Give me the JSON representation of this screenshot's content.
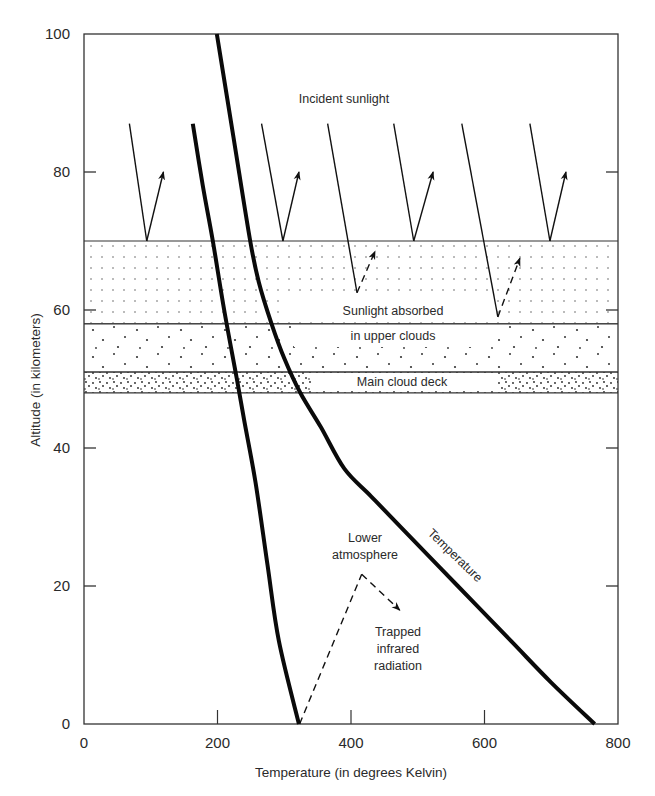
{
  "chart_data": {
    "type": "line",
    "title": "",
    "xlabel": "Temperature (in degrees Kelvin)",
    "ylabel": "Altitude (in kilometers)",
    "xlim": [
      0,
      800
    ],
    "ylim": [
      0,
      100
    ],
    "x_ticks": [
      0,
      200,
      400,
      600,
      800
    ],
    "y_ticks": [
      0,
      20,
      40,
      60,
      80,
      100
    ],
    "grid": false,
    "legend": null,
    "series": [
      {
        "name": "Temperature",
        "style": "thick solid",
        "points": [
          [
            199,
            100
          ],
          [
            224,
            85
          ],
          [
            249,
            70
          ],
          [
            262,
            64
          ],
          [
            281,
            58
          ],
          [
            300,
            53
          ],
          [
            324,
            48
          ],
          [
            355,
            43
          ],
          [
            390,
            37
          ],
          [
            430,
            33
          ],
          [
            480,
            28
          ],
          [
            560,
            20
          ],
          [
            640,
            12
          ],
          [
            700,
            6
          ],
          [
            765,
            0
          ]
        ]
      },
      {
        "name": "Lower curve",
        "style": "thick solid",
        "points": [
          [
            163,
            87
          ],
          [
            178,
            78
          ],
          [
            193,
            70
          ],
          [
            210,
            60
          ],
          [
            229,
            50
          ],
          [
            240,
            44
          ],
          [
            257,
            35
          ],
          [
            275,
            23
          ],
          [
            292,
            12
          ],
          [
            322,
            0
          ]
        ]
      }
    ],
    "layers": [
      {
        "name": "Upper cloud haze",
        "alt_top": 70,
        "alt_bottom": 58,
        "pattern": "fine-grid-dots"
      },
      {
        "name": "Upper clouds",
        "alt_top": 58,
        "alt_bottom": 51,
        "pattern": "sparse-dots"
      },
      {
        "name": "Main cloud deck",
        "alt_top": 51,
        "alt_bottom": 48,
        "pattern": "dense-dots"
      }
    ],
    "annotations": [
      {
        "text": "Incident sunlight",
        "x": 383,
        "y": 90
      },
      {
        "text": "Sunlight absorbed",
        "x": 480,
        "y": 60
      },
      {
        "text": "in upper clouds",
        "x": 480,
        "y": 56
      },
      {
        "text": "Main cloud deck",
        "x": 480,
        "y": 49.5
      },
      {
        "text": "Lower atmosphere",
        "x": 415,
        "y": 26
      },
      {
        "text": "Trapped infrared radiation",
        "x": 490,
        "y": 15
      },
      {
        "text": "Temperature",
        "x": 520,
        "y": 28,
        "rotation": 43
      }
    ],
    "arrows": [
      {
        "kind": "reflected",
        "from": [
          68,
          87
        ],
        "hit": [
          94,
          70
        ],
        "to": [
          119,
          80
        ]
      },
      {
        "kind": "reflected",
        "from": [
          266,
          87
        ],
        "hit": [
          298,
          70
        ],
        "to": [
          322,
          80
        ]
      },
      {
        "kind": "absorbed",
        "from": [
          365,
          87
        ],
        "hit": [
          409,
          62.5
        ],
        "to": [
          436,
          68.5
        ]
      },
      {
        "kind": "reflected",
        "from": [
          464,
          87
        ],
        "hit": [
          494,
          70
        ],
        "to": [
          523,
          80
        ]
      },
      {
        "kind": "absorbed",
        "from": [
          566,
          87
        ],
        "hit": [
          620,
          59
        ],
        "to": [
          653,
          67.5
        ]
      },
      {
        "kind": "reflected",
        "from": [
          668,
          87
        ],
        "hit": [
          698,
          70
        ],
        "to": [
          722,
          80
        ]
      },
      {
        "kind": "infrared",
        "from": [
          323,
          0
        ],
        "hit": [
          416,
          21.7
        ],
        "to": [
          473,
          16.5
        ]
      }
    ]
  },
  "labels": {
    "x_axis_title": "Temperature (in degrees Kelvin)",
    "y_axis_title": "Altitude (in kilometers)",
    "incident": "Incident sunlight",
    "absorbed_1": "Sunlight absorbed",
    "absorbed_2": "in upper clouds",
    "deck": "Main cloud deck",
    "lower_1": "Lower",
    "lower_2": "atmosphere",
    "trapped_1": "Trapped",
    "trapped_2": "infrared",
    "trapped_3": "radiation",
    "curve": "Temperature"
  }
}
